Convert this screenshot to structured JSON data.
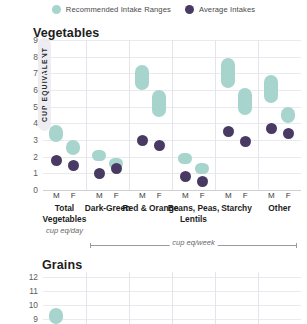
{
  "legend": {
    "items": [
      {
        "label": "Recommended Intake Ranges",
        "color": "#a8d4ce",
        "icon": "filled-circle-icon"
      },
      {
        "label": "Average Intakes",
        "color": "#483a62",
        "icon": "filled-circle-icon"
      }
    ]
  },
  "panels": {
    "vegetables_title": "Vegetables",
    "grains_title": "Grains"
  },
  "axis": {
    "y_label": "CUP EQUIVALENT",
    "unit_day": "cup eq/day",
    "unit_week": "cup eq/week"
  },
  "chart_data": {
    "type": "bar",
    "title": "Vegetables",
    "xlabel": "",
    "ylabel": "CUP EQUIVALENT",
    "ylim": [
      0,
      9
    ],
    "yticks": [
      0,
      1,
      2,
      3,
      4,
      5,
      6,
      7,
      8,
      9
    ],
    "grid": true,
    "legend_position": "top-center",
    "categories": [
      "Total Vegetables",
      "Dark-Green",
      "Red & Orange",
      "Beans, Peas, Lentils",
      "Starchy",
      "Other"
    ],
    "category_units": [
      "cup eq/day",
      "cup eq/week",
      "cup eq/week",
      "cup eq/week",
      "cup eq/week",
      "cup eq/week"
    ],
    "sexes": [
      "M",
      "F"
    ],
    "points": [
      {
        "category": "Total Vegetables",
        "sex": "M",
        "range_low": 2.9,
        "range_high": 3.9,
        "average": 1.8
      },
      {
        "category": "Total Vegetables",
        "sex": "F",
        "range_low": 2.1,
        "range_high": 3.0,
        "average": 1.5
      },
      {
        "category": "Dark-Green",
        "sex": "M",
        "range_low": 2.0,
        "range_high": 2.4,
        "average": 1.0
      },
      {
        "category": "Dark-Green",
        "sex": "F",
        "range_low": 1.5,
        "range_high": 1.9,
        "average": 1.3
      },
      {
        "category": "Red & Orange",
        "sex": "M",
        "range_low": 6.0,
        "range_high": 7.5,
        "average": 3.0
      },
      {
        "category": "Red & Orange",
        "sex": "F",
        "range_low": 4.4,
        "range_high": 6.0,
        "average": 2.7
      },
      {
        "category": "Beans, Peas, Lentils",
        "sex": "M",
        "range_low": 1.7,
        "range_high": 2.2,
        "average": 0.8
      },
      {
        "category": "Beans, Peas, Lentils",
        "sex": "F",
        "range_low": 1.2,
        "range_high": 1.6,
        "average": 0.5
      },
      {
        "category": "Starchy",
        "sex": "M",
        "range_low": 6.1,
        "range_high": 7.9,
        "average": 3.5
      },
      {
        "category": "Starchy",
        "sex": "F",
        "range_low": 4.5,
        "range_high": 6.1,
        "average": 2.9
      },
      {
        "category": "Other",
        "sex": "M",
        "range_low": 5.2,
        "range_high": 6.9,
        "average": 3.7
      },
      {
        "category": "Other",
        "sex": "F",
        "range_low": 4.0,
        "range_high": 5.0,
        "average": 3.4
      }
    ],
    "secondary_panel": {
      "title": "Grains",
      "ylim": [
        8.6,
        12.4
      ],
      "yticks": [
        9,
        10,
        11,
        12
      ],
      "partial_points": [
        {
          "category": "Total Grains",
          "sex": "M",
          "range_low": 8.6,
          "range_high": 9.8
        }
      ]
    }
  },
  "colors": {
    "range": "#a8d4ce",
    "average": "#483a62",
    "grid": "#e9e9ee",
    "axis": "#cfcfd6"
  }
}
